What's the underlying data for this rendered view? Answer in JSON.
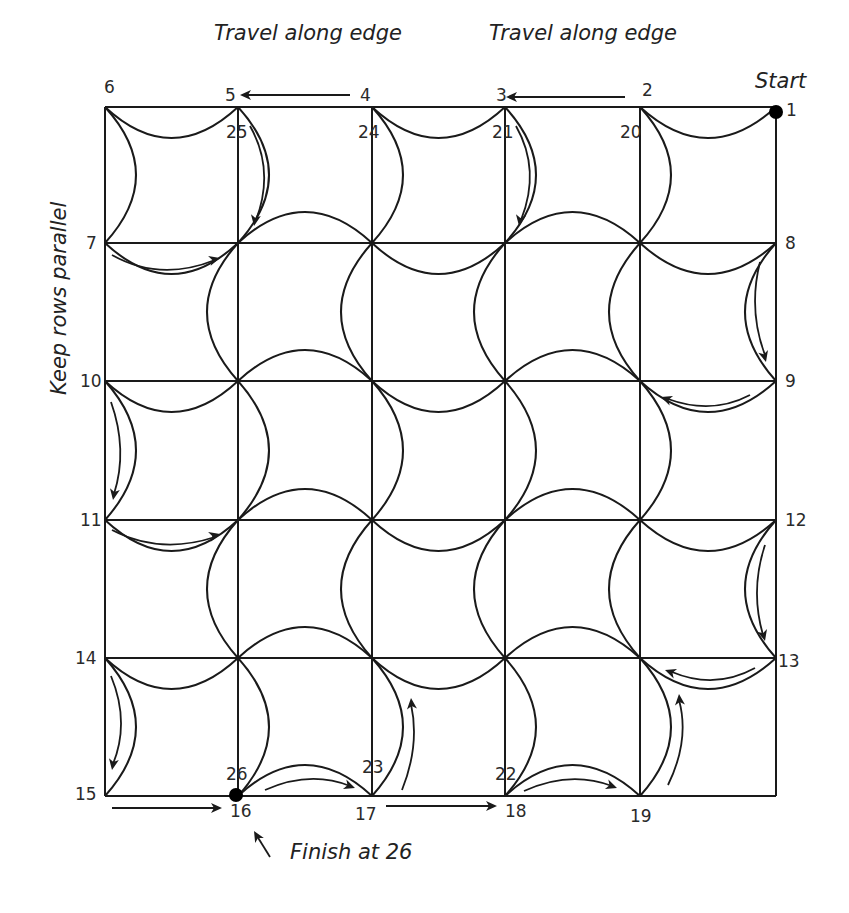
{
  "diagram": {
    "grid": {
      "xs": [
        105,
        238,
        372,
        505,
        640,
        776
      ],
      "ys": [
        107,
        243,
        381,
        520,
        658,
        796
      ],
      "arc_depth": 62,
      "line_color": "#1a1a1a"
    },
    "annotations": {
      "top_left": "Travel along edge",
      "top_right": "Travel along edge",
      "start": "Start",
      "side": "Keep rows parallel",
      "finish": "Finish at 26"
    },
    "node_labels": [
      {
        "text": "1",
        "x": 786,
        "y": 116
      },
      {
        "text": "2",
        "x": 642,
        "y": 96
      },
      {
        "text": "3",
        "x": 496,
        "y": 101
      },
      {
        "text": "4",
        "x": 360,
        "y": 101
      },
      {
        "text": "5",
        "x": 225,
        "y": 101
      },
      {
        "text": "6",
        "x": 104,
        "y": 93
      },
      {
        "text": "7",
        "x": 86,
        "y": 249
      },
      {
        "text": "8",
        "x": 785,
        "y": 249
      },
      {
        "text": "9",
        "x": 785,
        "y": 387
      },
      {
        "text": "10",
        "x": 80,
        "y": 387
      },
      {
        "text": "11",
        "x": 80,
        "y": 526
      },
      {
        "text": "12",
        "x": 785,
        "y": 526
      },
      {
        "text": "13",
        "x": 778,
        "y": 667
      },
      {
        "text": "14",
        "x": 75,
        "y": 664
      },
      {
        "text": "15",
        "x": 75,
        "y": 800
      },
      {
        "text": "16",
        "x": 230,
        "y": 817
      },
      {
        "text": "17",
        "x": 355,
        "y": 820
      },
      {
        "text": "18",
        "x": 505,
        "y": 817
      },
      {
        "text": "19",
        "x": 630,
        "y": 822
      },
      {
        "text": "20",
        "x": 620,
        "y": 138
      },
      {
        "text": "21",
        "x": 492,
        "y": 138
      },
      {
        "text": "22",
        "x": 495,
        "y": 780
      },
      {
        "text": "23",
        "x": 362,
        "y": 773
      },
      {
        "text": "24",
        "x": 358,
        "y": 138
      },
      {
        "text": "25",
        "x": 226,
        "y": 138
      },
      {
        "text": "26",
        "x": 226,
        "y": 780
      }
    ],
    "start_dot": {
      "x": 776,
      "y": 112
    },
    "finish_dot": {
      "x": 236,
      "y": 795
    },
    "arrows": [
      {
        "name": "edge-4-to-5",
        "d": "M350 95 L245 95",
        "head": [
          240,
          95,
          180
        ]
      },
      {
        "name": "edge-2-to-3",
        "d": "M625 97 L512 97",
        "head": [
          506,
          97,
          180
        ]
      },
      {
        "name": "arc-25-down",
        "d": "M250 126 Q275 170 256 220",
        "head": [
          254,
          226,
          100
        ]
      },
      {
        "name": "arc-21-down",
        "d": "M516 126 Q541 170 521 220",
        "head": [
          519,
          226,
          100
        ]
      },
      {
        "name": "arc-7-right",
        "d": "M112 255 Q160 282 215 260",
        "head": [
          220,
          258,
          -15
        ]
      },
      {
        "name": "arc-8-down",
        "d": "M760 262 Q748 310 765 355",
        "head": [
          766,
          362,
          75
        ]
      },
      {
        "name": "arc-9-left",
        "d": "M750 395 Q712 415 668 399",
        "head": [
          661,
          397,
          200
        ]
      },
      {
        "name": "arc-10-down",
        "d": "M111 402 Q128 450 114 494",
        "head": [
          113,
          500,
          100
        ]
      },
      {
        "name": "arc-11-right",
        "d": "M112 530 Q160 555 215 537",
        "head": [
          220,
          534,
          -15
        ]
      },
      {
        "name": "arc-12-down",
        "d": "M765 545 Q750 590 763 635",
        "head": [
          765,
          641,
          75
        ]
      },
      {
        "name": "arc-13-left",
        "d": "M755 668 Q715 690 672 672",
        "head": [
          665,
          670,
          200
        ]
      },
      {
        "name": "arc-19-up",
        "d": "M668 785 Q690 740 679 700",
        "head": [
          679,
          694,
          -95
        ]
      },
      {
        "name": "arc-14-down",
        "d": "M111 676 Q130 722 113 764",
        "head": [
          112,
          770,
          100
        ]
      },
      {
        "name": "edge-15-to-16",
        "d": "M112 808 L215 808",
        "head": [
          222,
          808,
          0
        ]
      },
      {
        "name": "arc-26-right",
        "d": "M265 790 Q310 770 350 786",
        "head": [
          355,
          788,
          20
        ]
      },
      {
        "name": "arc-17-up",
        "d": "M402 790 Q420 745 411 704",
        "head": [
          411,
          698,
          -95
        ]
      },
      {
        "name": "edge-17-to-18",
        "d": "M386 806 L490 806",
        "head": [
          497,
          806,
          0
        ]
      },
      {
        "name": "arc-22-right",
        "d": "M524 791 Q570 770 612 786",
        "head": [
          617,
          788,
          20
        ]
      },
      {
        "name": "finish-pointer",
        "d": "M270 857 L257 836",
        "head": [
          254,
          831,
          -120
        ]
      }
    ]
  }
}
